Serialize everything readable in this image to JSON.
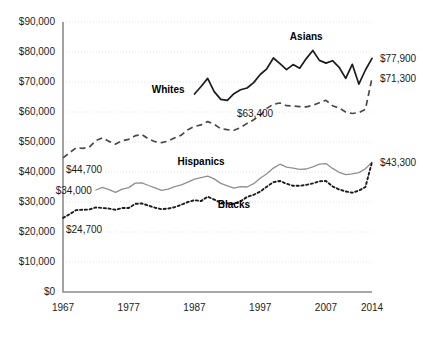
{
  "chart_data": {
    "type": "line",
    "title": "",
    "subtitle": "",
    "xlabel": "",
    "ylabel": "",
    "xlim": [
      1967,
      2014
    ],
    "ylim": [
      0,
      90000
    ],
    "grid": true,
    "legend_position": "inline-labels",
    "y_ticks": [
      0,
      10000,
      20000,
      30000,
      40000,
      50000,
      60000,
      70000,
      80000,
      90000
    ],
    "y_tick_labels": [
      "$0",
      "$10,000",
      "$20,000",
      "$30,000",
      "$40,000",
      "$50,000",
      "$60,000",
      "$70,000",
      "$80,000",
      "$90,000"
    ],
    "x_ticks": [
      1967,
      1977,
      1987,
      1997,
      2007,
      2014
    ],
    "x_tick_labels": [
      "1967",
      "1977",
      "1987",
      "1997",
      "2007",
      "2014"
    ],
    "annotations": [
      {
        "id": "whites-start",
        "text": "$44,700",
        "x": 1967,
        "y": 44700,
        "placement": "below-right"
      },
      {
        "id": "whites-mid",
        "text": "$63,400",
        "x": 1993,
        "y": 63400,
        "placement": "below-right"
      },
      {
        "id": "blacks-start",
        "text": "$24,700",
        "x": 1967,
        "y": 24700,
        "placement": "below-right"
      },
      {
        "id": "hispanics-start",
        "text": "$34,000",
        "x": 1972,
        "y": 34000,
        "placement": "left"
      },
      {
        "id": "asians-end",
        "text": "$77,900",
        "x": 2014,
        "y": 77900,
        "placement": "right"
      },
      {
        "id": "whites-end",
        "text": "$71,300",
        "x": 2014,
        "y": 71300,
        "placement": "right"
      },
      {
        "id": "hispanics-end",
        "text": "$43,300",
        "x": 2014,
        "y": 43300,
        "placement": "right"
      }
    ],
    "series": [
      {
        "name": "Asians",
        "style": "solid",
        "color": "#1c1c1c",
        "label_x": 2004,
        "label_y": 84000,
        "x": [
          1987,
          1988,
          1989,
          1990,
          1991,
          1992,
          1993,
          1994,
          1995,
          1996,
          1997,
          1998,
          1999,
          2000,
          2001,
          2002,
          2003,
          2004,
          2005,
          2006,
          2007,
          2008,
          2009,
          2010,
          2011,
          2012,
          2013,
          2014
        ],
        "values": [
          66000,
          68500,
          71200,
          66800,
          64200,
          63900,
          66100,
          67400,
          68000,
          69800,
          72500,
          74400,
          78000,
          76100,
          74100,
          75800,
          74600,
          77800,
          80500,
          77200,
          76300,
          77100,
          74900,
          71200,
          75900,
          69300,
          74000,
          77900
        ]
      },
      {
        "name": "Whites",
        "style": "dashed",
        "color": "#4a4a4a",
        "label_x": 1983,
        "label_y": 66500,
        "x": [
          1967,
          1968,
          1969,
          1970,
          1971,
          1972,
          1973,
          1974,
          1975,
          1976,
          1977,
          1978,
          1979,
          1980,
          1981,
          1982,
          1983,
          1984,
          1985,
          1986,
          1987,
          1988,
          1989,
          1990,
          1991,
          1992,
          1993,
          1994,
          1995,
          1996,
          1997,
          1998,
          1999,
          2000,
          2001,
          2002,
          2003,
          2004,
          2005,
          2006,
          2007,
          2008,
          2009,
          2010,
          2011,
          2012,
          2013,
          2014
        ],
        "values": [
          44700,
          46400,
          48100,
          47900,
          48300,
          50500,
          51400,
          50200,
          49300,
          50400,
          50900,
          52100,
          52500,
          51000,
          50100,
          49800,
          50300,
          51400,
          52300,
          54100,
          55200,
          55700,
          56800,
          55900,
          54400,
          54100,
          53900,
          54800,
          56200,
          57400,
          58900,
          61200,
          62600,
          63000,
          62100,
          62000,
          61800,
          61700,
          62200,
          63100,
          63900,
          62100,
          61300,
          60000,
          59500,
          59800,
          60900,
          71300
        ]
      },
      {
        "name": "Hispanics",
        "style": "solid-thin",
        "color": "#8f8f8f",
        "label_x": 1988,
        "label_y": 42500,
        "x": [
          1972,
          1973,
          1974,
          1975,
          1976,
          1977,
          1978,
          1979,
          1980,
          1981,
          1982,
          1983,
          1984,
          1985,
          1986,
          1987,
          1988,
          1989,
          1990,
          1991,
          1992,
          1993,
          1994,
          1995,
          1996,
          1997,
          1998,
          1999,
          2000,
          2001,
          2002,
          2003,
          2004,
          2005,
          2006,
          2007,
          2008,
          2009,
          2010,
          2011,
          2012,
          2013,
          2014
        ],
        "values": [
          34000,
          34900,
          34100,
          33200,
          34300,
          34800,
          36300,
          36400,
          35500,
          34700,
          33900,
          34300,
          35100,
          35700,
          36600,
          37600,
          38100,
          38600,
          37700,
          36200,
          35400,
          34600,
          35100,
          35000,
          36100,
          37900,
          39400,
          41300,
          42600,
          41600,
          41300,
          40900,
          41000,
          41700,
          42600,
          42800,
          41200,
          39900,
          39100,
          39400,
          39800,
          41100,
          43300
        ]
      },
      {
        "name": "Blacks",
        "style": "dotted",
        "color": "#1c1c1c",
        "label_x": 1993,
        "label_y": 28000,
        "x": [
          1967,
          1968,
          1969,
          1970,
          1971,
          1972,
          1973,
          1974,
          1975,
          1976,
          1977,
          1978,
          1979,
          1980,
          1981,
          1982,
          1983,
          1984,
          1985,
          1986,
          1987,
          1988,
          1989,
          1990,
          1991,
          1992,
          1993,
          1994,
          1995,
          1996,
          1997,
          1998,
          1999,
          2000,
          2001,
          2002,
          2003,
          2004,
          2005,
          2006,
          2007,
          2008,
          2009,
          2010,
          2011,
          2012,
          2013,
          2014
        ],
        "values": [
          24700,
          25900,
          27300,
          27400,
          27500,
          28200,
          28000,
          27800,
          27400,
          28000,
          28000,
          29400,
          29500,
          28800,
          28100,
          27600,
          27800,
          28300,
          29100,
          30000,
          30600,
          30300,
          31800,
          30800,
          29800,
          29500,
          29400,
          30200,
          31700,
          32400,
          33500,
          35100,
          36600,
          37000,
          36100,
          35400,
          35400,
          35700,
          36200,
          36900,
          37000,
          35200,
          34200,
          33500,
          33100,
          33800,
          35000,
          43300
        ]
      }
    ]
  },
  "axis": {
    "y_axis_name": "income-axis",
    "x_axis_name": "year-axis"
  }
}
